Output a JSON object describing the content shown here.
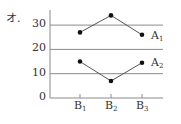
{
  "chart_data": {
    "type": "line",
    "title": "オ.",
    "xlabel": "",
    "ylabel": "",
    "categories": [
      "B1",
      "B2",
      "B3"
    ],
    "series": [
      {
        "name": "A1",
        "values": [
          27,
          34,
          26
        ]
      },
      {
        "name": "A2",
        "values": [
          15,
          7,
          14.5
        ]
      }
    ],
    "ylim": [
      0,
      35
    ],
    "yticks": [
      0,
      10,
      20,
      30
    ],
    "grid": true,
    "legend_position": "inline-right"
  },
  "labels": {
    "title": "オ.",
    "y_ticks": [
      "0",
      "10",
      "20",
      "30"
    ],
    "x_ticks": [
      {
        "main": "B",
        "sub": "1"
      },
      {
        "main": "B",
        "sub": "2"
      },
      {
        "main": "B",
        "sub": "3"
      }
    ],
    "series_labels": [
      {
        "main": "A",
        "sub": "1"
      },
      {
        "main": "A",
        "sub": "2"
      }
    ]
  },
  "colors": {
    "axis": "#8a8a8a",
    "grid": "#8a8a8a",
    "line": "#555555",
    "marker": "#111111",
    "text": "#333333"
  }
}
